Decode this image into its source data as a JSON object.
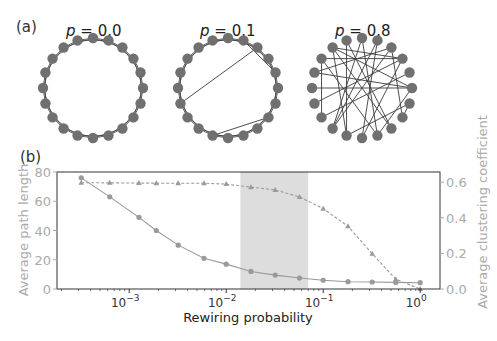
{
  "panel_a": {
    "label": "(a)",
    "networks": [
      {
        "p_symbol": "p",
        "p_text": " = 0.0",
        "p": 0.0,
        "n_nodes": 20,
        "chords": []
      },
      {
        "p_symbol": "p",
        "p_text": " = 0.1",
        "p": 0.1,
        "n_nodes": 20,
        "chords": [
          [
            1,
            4
          ],
          [
            2,
            14
          ],
          [
            7,
            11
          ]
        ]
      },
      {
        "p_symbol": "p",
        "p_text": " = 0.8",
        "p": 0.8,
        "n_nodes": 20,
        "chords": [
          [
            18,
            3
          ],
          [
            18,
            5
          ],
          [
            18,
            8
          ],
          [
            18,
            11
          ],
          [
            17,
            3
          ],
          [
            17,
            9
          ],
          [
            17,
            13
          ],
          [
            16,
            5
          ],
          [
            16,
            2
          ],
          [
            1,
            10
          ],
          [
            1,
            12
          ],
          [
            2,
            12
          ],
          [
            2,
            7
          ],
          [
            19,
            8
          ],
          [
            19,
            11
          ],
          [
            0,
            9
          ],
          [
            0,
            12
          ],
          [
            3,
            10
          ],
          [
            4,
            13
          ],
          [
            11,
            6
          ],
          [
            15,
            5
          ],
          [
            14,
            3
          ],
          [
            5,
            9
          ],
          [
            6,
            7
          ]
        ]
      }
    ]
  },
  "panel_b": {
    "label": "(b)"
  },
  "colors": {
    "node": "#707070",
    "edge": "#3a3a3a",
    "series": "#9a9a9a",
    "shade": "#dddddd",
    "axis_grey": "#aaaaaa",
    "axis_dark": "#333333"
  },
  "chart_data": {
    "type": "line",
    "title": "",
    "xlabel": "Rewiring probability",
    "ylabel": "Average path length",
    "y2label": "Average clustering coefficient",
    "xscale": "log",
    "xlim": [
      0.00018,
      1.6
    ],
    "ylim": [
      0,
      80
    ],
    "y2lim": [
      0,
      0.657
    ],
    "xticks": [
      {
        "value": 0.001,
        "base": "10",
        "exp": "−3"
      },
      {
        "value": 0.01,
        "base": "10",
        "exp": "−2"
      },
      {
        "value": 0.1,
        "base": "10",
        "exp": "−1"
      },
      {
        "value": 1,
        "base": "10",
        "exp": "0"
      }
    ],
    "yticks": [
      "0",
      "20",
      "40",
      "60",
      "80"
    ],
    "y2ticks": [
      "0.0",
      "0.2",
      "0.4",
      "0.6"
    ],
    "grid": false,
    "shaded_region": {
      "x_from": 0.014,
      "x_to": 0.07
    },
    "x": [
      0.00032,
      0.00063,
      0.00126,
      0.0019,
      0.0032,
      0.0059,
      0.01,
      0.018,
      0.032,
      0.057,
      0.1,
      0.18,
      0.32,
      0.56,
      1.0
    ],
    "series": [
      {
        "name": "Average path length",
        "axis": "left",
        "marker": "circle",
        "linestyle": "solid",
        "values": [
          76,
          63,
          49,
          40,
          30,
          21,
          17,
          12,
          9.5,
          7.5,
          6,
          5,
          4.8,
          4.5,
          4.3
        ]
      },
      {
        "name": "Average clustering coefficient",
        "axis": "right",
        "marker": "triangle",
        "linestyle": "dashed",
        "values": [
          0.597,
          0.596,
          0.595,
          0.594,
          0.594,
          0.594,
          0.589,
          0.572,
          0.556,
          0.517,
          0.451,
          0.352,
          0.198,
          0.055,
          0.0
        ]
      }
    ]
  }
}
